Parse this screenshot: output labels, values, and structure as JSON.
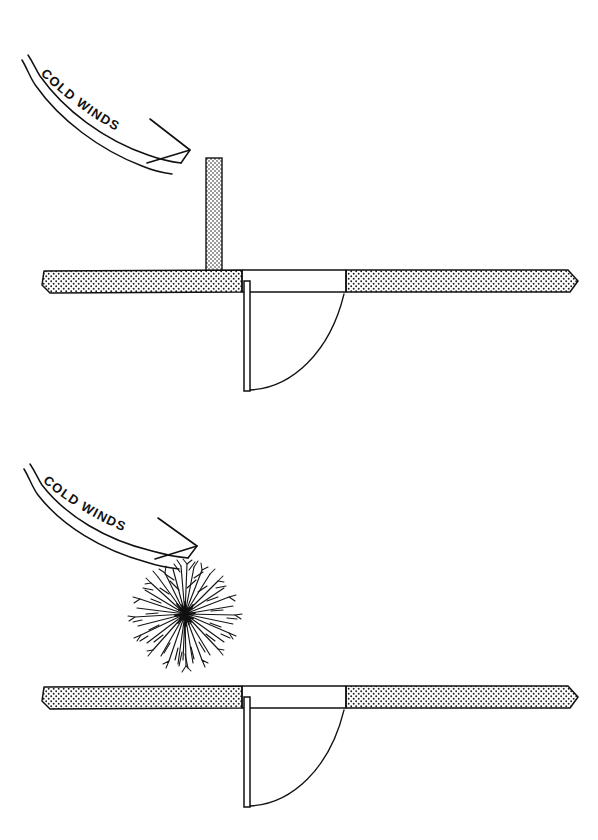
{
  "drawing": {
    "title": "Cold Winds Entry Windbreak Plan",
    "background_color": "#ffffff",
    "ink_color": "#111111",
    "wall_fill_color": "#f2f2f2",
    "stipple_dot_color": "#1a1a1a",
    "width": 598,
    "height": 840
  },
  "panels": [
    {
      "id": "panel-top",
      "caption": "Wall baffle windbreak at entry",
      "wind_label": "COLD WINDS",
      "windbreak_type": "masonry wall stub",
      "elements": {
        "wall": {
          "left": 42,
          "right": 578,
          "top": 270,
          "bottom": 292
        },
        "door_opening": {
          "left": 242,
          "right": 346
        },
        "door_leaf": {
          "x": 244,
          "top": 282,
          "bottom": 390,
          "thickness": 6
        },
        "swing_arc": {
          "radius": 104,
          "hinge_x": 247,
          "hinge_y": 286
        },
        "wall_stub": {
          "x": 206,
          "width": 16,
          "top": 158,
          "bottom": 272
        },
        "wind_arrow": {
          "start_x": 30,
          "start_y": 58,
          "end_x": 188,
          "end_y": 152
        }
      }
    },
    {
      "id": "panel-bottom",
      "caption": "Shrub planting windbreak at entry",
      "wind_label": "COLD WINDS",
      "windbreak_type": "dense shrub mass",
      "elements": {
        "wall": {
          "left": 42,
          "right": 578,
          "top": 686,
          "bottom": 708
        },
        "door_opening": {
          "left": 242,
          "right": 346
        },
        "door_leaf": {
          "x": 244,
          "top": 698,
          "bottom": 806,
          "thickness": 6
        },
        "swing_arc": {
          "radius": 104,
          "hinge_x": 247,
          "hinge_y": 702
        },
        "shrub": {
          "center_x": 185,
          "center_y": 614,
          "radius": 55
        },
        "wind_arrow": {
          "start_x": 30,
          "start_y": 468,
          "end_x": 195,
          "end_y": 545
        }
      }
    }
  ],
  "labels": {
    "cold_winds_top": "COLD WINDS",
    "cold_winds_bottom": "COLD WINDS"
  }
}
